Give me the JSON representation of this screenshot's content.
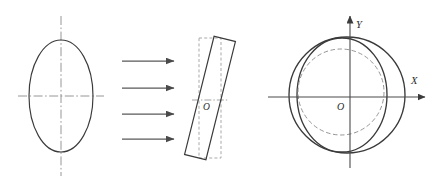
{
  "figure": {
    "background_color": "#ffffff",
    "line_color": "#3a3a3a",
    "centerline_color": "#8a8a8a",
    "dashed_color": "#8f8f8f",
    "arrow_color": "#5a5a5a",
    "axis_color": "#4a4a4a",
    "panels": [
      {
        "id": "panel-left",
        "name": "original-ellipse-panel",
        "shapes": [
          {
            "kind": "ellipse",
            "name": "original-ellipse",
            "cx": 61,
            "cy": 96,
            "rx": 32,
            "ry": 56,
            "style": "solid"
          },
          {
            "kind": "centerline-vertical",
            "name": "vertical-centerline",
            "x": 61,
            "y1": 16,
            "y2": 176
          },
          {
            "kind": "centerline-horizontal",
            "name": "horizontal-centerline",
            "y": 96,
            "x1": 18,
            "x2": 104
          }
        ]
      },
      {
        "id": "panel-arrows",
        "name": "transformation-arrows-panel",
        "arrows": [
          {
            "name": "arrow-1",
            "x1": 122,
            "y1": 61,
            "x2": 177,
            "y2": 61
          },
          {
            "name": "arrow-2",
            "x1": 122,
            "y1": 88,
            "x2": 177,
            "y2": 88
          },
          {
            "name": "arrow-3",
            "x1": 122,
            "y1": 114,
            "x2": 177,
            "y2": 114
          },
          {
            "name": "arrow-4",
            "x1": 122,
            "y1": 139,
            "x2": 177,
            "y2": 139
          }
        ]
      },
      {
        "id": "panel-middle",
        "name": "rotated-section-panel",
        "origin_label": "O",
        "origin_x": 207,
        "origin_y": 100,
        "shapes": [
          {
            "kind": "rect-dashed",
            "name": "reference-rectangle",
            "x": 199,
            "y": 38,
            "width": 22,
            "height": 120,
            "style": "dashed"
          },
          {
            "kind": "rect-rotated",
            "name": "rotated-rectangle",
            "cx": 210,
            "cy": 98,
            "width": 22,
            "height": 122,
            "rotation_deg": 14,
            "style": "solid"
          }
        ]
      },
      {
        "id": "panel-right",
        "name": "coordinate-system-panel",
        "origin_label": "O",
        "axis_x_label": "X",
        "axis_y_label": "Y",
        "origin_x": 350,
        "origin_y": 97,
        "axes": {
          "x_start": 268,
          "x_end": 428,
          "y_start": 168,
          "y_end": 13
        },
        "shapes": [
          {
            "kind": "circle",
            "name": "outer-circle",
            "cx": 347,
            "cy": 95,
            "r": 58,
            "style": "solid"
          },
          {
            "kind": "ellipse",
            "name": "inner-ellipse",
            "cx": 342,
            "cy": 95,
            "rx": 45,
            "ry": 57,
            "style": "solid"
          },
          {
            "kind": "circle",
            "name": "dashed-circle",
            "cx": 341,
            "cy": 92,
            "r": 43,
            "style": "dashed"
          }
        ]
      }
    ]
  }
}
